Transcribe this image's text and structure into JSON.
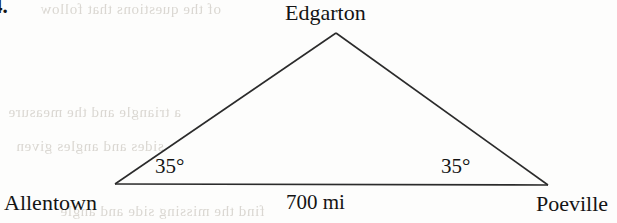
{
  "item": {
    "number": "4."
  },
  "diagram": {
    "type": "triangle",
    "stroke_color": "#2b2b2b",
    "vertices": [
      {
        "name": "apex",
        "label": "Edgarton",
        "x": 336,
        "y": 33
      },
      {
        "name": "bottom-left",
        "label": "Allentown",
        "x": 115,
        "y": 184
      },
      {
        "name": "bottom-right",
        "label": "Poeville",
        "x": 548,
        "y": 185
      }
    ],
    "angles": [
      {
        "at": "Allentown",
        "value": "35°"
      },
      {
        "at": "Poeville",
        "value": "35°"
      }
    ],
    "sides": [
      {
        "from": "Allentown",
        "to": "Poeville",
        "label": "700 mi"
      }
    ]
  },
  "labels": {
    "apex": "Edgarton",
    "left_vertex": "Allentown",
    "right_vertex": "Poeville",
    "angle_left": "35°",
    "angle_right": "35°",
    "base_side": "700 mi"
  },
  "ghost_text": {
    "top": "of the questions that follow",
    "mid1": "a triangle and the measure",
    "mid2": "sides and angles given",
    "bottom": "find the missing side and angle"
  }
}
